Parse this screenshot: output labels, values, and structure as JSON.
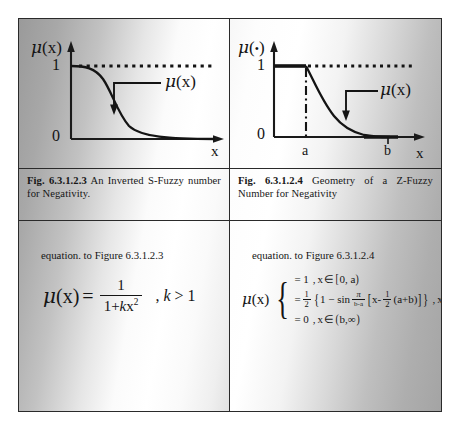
{
  "document": {
    "kind": "figure-table",
    "columns": 2,
    "rows": [
      "figures",
      "captions",
      "equations"
    ]
  },
  "left": {
    "figure": {
      "name": "inverted-s-fuzzy-number-chart",
      "y_axis_label": "μ(x)",
      "x_axis_label": "x",
      "y_ticks": [
        "1",
        "0"
      ],
      "curve_annotation": "μ(x)",
      "dotted_reference_level": "1",
      "description": "Inverted S-shaped decreasing membership curve from 1 to 0"
    },
    "caption": {
      "label": "Fig. 6.3.1.2.3",
      "text": "An Inverted S-Fuzzy number for Negativity."
    },
    "equation_intro": "equation. to Figure 6.3.1.2.3",
    "equation": {
      "lhs": "μ(x)",
      "equals": "=",
      "numerator": "1",
      "denominator_a": "1+",
      "denominator_k": "k",
      "denominator_x": "x",
      "denominator_exp": "2",
      "condition_comma": ",",
      "condition_k": "k",
      "condition_rel": "> 1"
    }
  },
  "right": {
    "figure": {
      "name": "z-fuzzy-number-chart",
      "y_axis_label": "μ(•)",
      "x_axis_label": "x",
      "y_ticks": [
        "1",
        "0"
      ],
      "x_ticks": [
        "a",
        "b"
      ],
      "curve_annotation": "μ(x)",
      "dotted_reference_level": "1",
      "description": "Z-shaped membership: flat at 1 until a, sinusoidal decrease to 0 at b"
    },
    "caption": {
      "label": "Fig. 6.3.1.2.4",
      "text": "Geometry of a Z-Fuzzy Number for Negativity"
    },
    "equation_intro": "equation. to Figure 6.3.1.2.4",
    "equation": {
      "lhs": "μ(x)",
      "pieces": [
        {
          "value": "= 1",
          "comma": ",",
          "domain_var": "x",
          "member": "∈",
          "interval_open": "[",
          "interval_text": "0, a",
          "interval_close": ")"
        },
        {
          "value_eq": "=",
          "half_n": "1",
          "half_d": "2",
          "open_brace": "{",
          "one_minus": "1 − sin",
          "pi_n": "π",
          "pi_d": "b-a",
          "open_bracket": "[",
          "x_term": "x-",
          "half2_n": "1",
          "half2_d": "2",
          "ab_term": "(a+b)",
          "close_bracket": "]",
          "close_brace": "}",
          "comma": ",",
          "domain_var": "x",
          "member": "∈",
          "interval_open": "[",
          "interval_text": "a,b",
          "interval_close": "]"
        },
        {
          "value": "= 0",
          "comma": ",",
          "domain_var": "x",
          "member": "∈",
          "interval_open": "(",
          "interval_text": "b,∞",
          "interval_close": ")"
        }
      ]
    }
  },
  "colors": {
    "ink": "#161616",
    "rule": "#2a2a2a",
    "paper_light": "#ffffff",
    "paper_shadow": "#9a9a9a"
  }
}
